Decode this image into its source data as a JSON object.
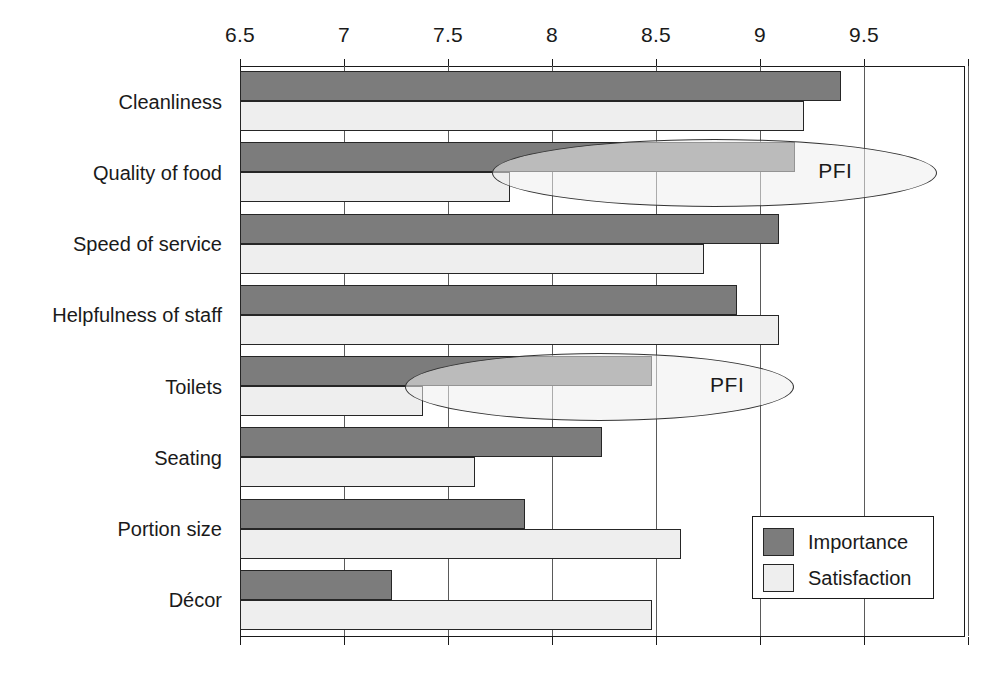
{
  "chart_data": {
    "type": "bar",
    "orientation": "horizontal",
    "title": "",
    "xlabel": "",
    "ylabel": "",
    "xlim": [
      6.5,
      10
    ],
    "xticks": [
      6.5,
      7,
      7.5,
      8,
      8.5,
      9,
      9.5,
      10
    ],
    "xtick_labels": [
      "6.5",
      "7",
      "7.5",
      "8",
      "8.5",
      "9",
      "9.5",
      ""
    ],
    "grid": true,
    "grid_axis": "x",
    "legend_position": "bottom-right",
    "categories": [
      "Cleanliness",
      "Quality of food",
      "Speed of service",
      "Helpfulness of staff",
      "Toilets",
      "Seating",
      "Portion size",
      "Décor"
    ],
    "series": [
      {
        "name": "Importance",
        "color": "#7c7c7c",
        "values": [
          9.39,
          9.17,
          9.09,
          8.89,
          8.48,
          8.24,
          7.87,
          7.23
        ]
      },
      {
        "name": "Satisfaction",
        "color": "#eeeeee",
        "values": [
          9.21,
          7.8,
          8.73,
          9.09,
          7.38,
          7.63,
          8.62,
          8.48
        ]
      }
    ],
    "annotations": [
      {
        "label": "PFI",
        "category": "Quality of food",
        "x_text": 9.28
      },
      {
        "label": "PFI",
        "category": "Toilets",
        "x_text": 8.76
      }
    ]
  },
  "legend": {
    "entries": [
      {
        "label": "Importance",
        "color": "#7c7c7c"
      },
      {
        "label": "Satisfaction",
        "color": "#eeeeee"
      }
    ]
  }
}
